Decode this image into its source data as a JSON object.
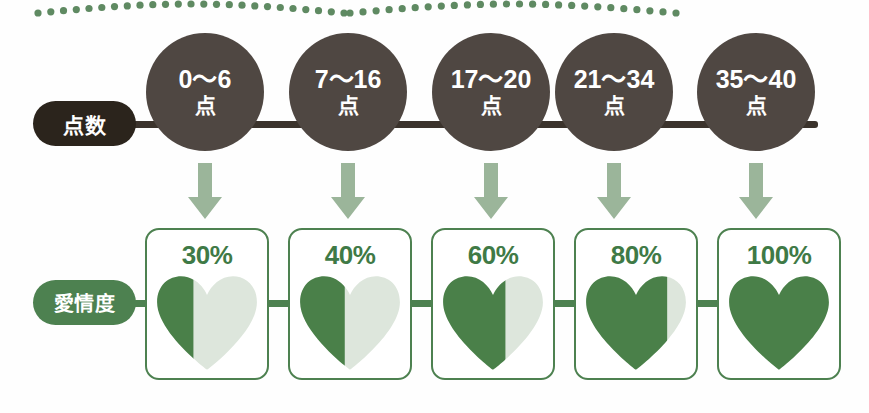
{
  "colors": {
    "dark_pill": "#2b241c",
    "circle": "#4f4742",
    "rail": "#3b332c",
    "green": "#4d8150",
    "heart_fill": "#4a8049",
    "heart_empty": "#dde6dc",
    "arrow": "#9bb59a",
    "dot": "#5f8a62",
    "pct_text": "#3f7a46"
  },
  "decor": {
    "dotted_arc_left_name": "dotted-arc-left",
    "dotted_arc_right_name": "dotted-arc-right"
  },
  "score_row": {
    "label": "点数",
    "unit": "点",
    "buckets": [
      {
        "range": "0〜6",
        "unit": "点"
      },
      {
        "range": "7〜16",
        "unit": "点"
      },
      {
        "range": "17〜20",
        "unit": "点"
      },
      {
        "range": "21〜34",
        "unit": "点"
      },
      {
        "range": "35〜40",
        "unit": "点"
      }
    ]
  },
  "love_row": {
    "label": "愛情度",
    "cards": [
      {
        "percent_label": "30%",
        "percent_value": 30,
        "fill_ratio": 0.37
      },
      {
        "percent_label": "40%",
        "percent_value": 40,
        "fill_ratio": 0.45
      },
      {
        "percent_label": "60%",
        "percent_value": 60,
        "fill_ratio": 0.62
      },
      {
        "percent_label": "80%",
        "percent_value": 80,
        "fill_ratio": 0.8
      },
      {
        "percent_label": "100%",
        "percent_value": 100,
        "fill_ratio": 1.0
      }
    ]
  },
  "chart_data": {
    "type": "table",
    "categories": [
      "0〜6点",
      "7〜16点",
      "17〜20点",
      "21〜34点",
      "35〜40点"
    ],
    "series": [
      {
        "name": "愛情度",
        "values": [
          30,
          40,
          60,
          80,
          100
        ],
        "unit": "%"
      }
    ],
    "xlabel": "点数",
    "ylabel": "愛情度",
    "ylim": [
      0,
      100
    ]
  }
}
